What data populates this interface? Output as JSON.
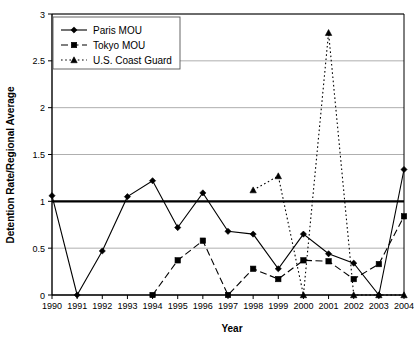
{
  "chart_data": {
    "type": "line",
    "title": "",
    "xlabel": "Year",
    "ylabel": "Detention Rate/Regional Average",
    "x": [
      1990,
      1991,
      1992,
      1993,
      1994,
      1995,
      1996,
      1997,
      1998,
      1999,
      2000,
      2001,
      2002,
      2003,
      2004
    ],
    "categories": [
      "1990",
      "1991",
      "1992",
      "1993",
      "1994",
      "1995",
      "1996",
      "1997",
      "1998",
      "1999",
      "2000",
      "2001",
      "2002",
      "2003",
      "2004"
    ],
    "xlim": [
      1990,
      2004
    ],
    "ylim": [
      0,
      3
    ],
    "yticks": [
      0,
      0.5,
      1,
      1.5,
      2,
      2.5,
      3
    ],
    "ytick_labels": [
      "0",
      "0.5",
      "1",
      "1.5",
      "2",
      "2.5",
      "3"
    ],
    "grid": true,
    "grid_axis": "y",
    "legend_position": "top-left",
    "reference_line": {
      "value": 1,
      "color": "#000000",
      "width": 2.2
    },
    "series": [
      {
        "name": "Paris MOU",
        "marker": "diamond",
        "dash": "solid",
        "color": "#000000",
        "x": [
          1990,
          1991,
          1992,
          1993,
          1994,
          1995,
          1996,
          1997,
          1998,
          1999,
          2000,
          2001,
          2002,
          2003,
          2004
        ],
        "values": [
          1.06,
          0,
          0.47,
          1.05,
          1.22,
          0.72,
          1.09,
          0.68,
          0.65,
          0.28,
          0.65,
          0.44,
          0.34,
          0,
          1.34
        ]
      },
      {
        "name": "Tokyo MOU",
        "marker": "square",
        "dash": "dashed",
        "color": "#000000",
        "x": [
          1994,
          1995,
          1996,
          1997,
          1998,
          1999,
          2000,
          2001,
          2002,
          2003,
          2004
        ],
        "values": [
          0,
          0.37,
          0.58,
          0,
          0.28,
          0.17,
          0.37,
          0.36,
          0.17,
          0.33,
          0.84
        ]
      },
      {
        "name": "U.S. Coast Guard",
        "marker": "triangle",
        "dash": "dotted",
        "color": "#000000",
        "x": [
          1998,
          1999,
          2000,
          2001,
          2002,
          2003,
          2004
        ],
        "values": [
          1.12,
          1.27,
          0,
          2.8,
          0,
          0,
          0
        ]
      }
    ]
  },
  "legend": {
    "items": [
      {
        "label": "Paris MOU"
      },
      {
        "label": "Tokyo MOU"
      },
      {
        "label": "U.S. Coast Guard"
      }
    ]
  }
}
